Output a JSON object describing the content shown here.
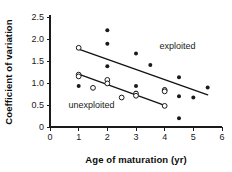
{
  "chart_data": {
    "type": "scatter",
    "title": "",
    "xlabel": "Age of maturation (yr)",
    "ylabel": "Coefficient of variation",
    "xlim": [
      0,
      6
    ],
    "ylim": [
      0,
      2.5
    ],
    "xticks": [
      "0",
      "1",
      "2",
      "3",
      "4",
      "5",
      "6"
    ],
    "xtick_values": [
      0,
      1,
      2,
      3,
      4,
      5,
      6
    ],
    "yticks": [
      "0",
      "0.5",
      "1.0",
      "1.5",
      "2.0",
      "2.5"
    ],
    "ytick_values": [
      0,
      0.5,
      1.0,
      1.5,
      2.0,
      2.5
    ],
    "grid": false,
    "legend_position": "in-plot-annotations",
    "series": [
      {
        "name": "exploited",
        "marker": "filled-circle",
        "color": "#1a1a1a",
        "label_text": "exploited",
        "label_x": 4.45,
        "label_y": 1.78,
        "points": [
          {
            "x": 1.0,
            "y": 0.93
          },
          {
            "x": 2.0,
            "y": 2.2
          },
          {
            "x": 2.0,
            "y": 1.89
          },
          {
            "x": 2.0,
            "y": 1.38
          },
          {
            "x": 3.0,
            "y": 1.67
          },
          {
            "x": 3.0,
            "y": 0.93
          },
          {
            "x": 3.0,
            "y": 0.78
          },
          {
            "x": 3.5,
            "y": 1.41
          },
          {
            "x": 4.0,
            "y": 0.86
          },
          {
            "x": 4.5,
            "y": 1.13
          },
          {
            "x": 4.5,
            "y": 0.7
          },
          {
            "x": 4.5,
            "y": 0.2
          },
          {
            "x": 5.0,
            "y": 0.67
          },
          {
            "x": 5.5,
            "y": 0.9
          },
          {
            "x": 2.5,
            "y": 0.68
          }
        ],
        "trend": {
          "x1": 1.0,
          "y1": 1.77,
          "x2": 5.5,
          "y2": 0.73
        }
      },
      {
        "name": "unexploited",
        "marker": "open-circle",
        "color": "#1a1a1a",
        "label_text": "unexploited",
        "label_x": 1.45,
        "label_y": 0.44,
        "points": [
          {
            "x": 1.0,
            "y": 1.8
          },
          {
            "x": 1.0,
            "y": 1.19
          },
          {
            "x": 1.0,
            "y": 1.15
          },
          {
            "x": 1.5,
            "y": 0.89
          },
          {
            "x": 2.0,
            "y": 1.07
          },
          {
            "x": 2.0,
            "y": 0.99
          },
          {
            "x": 2.5,
            "y": 0.67
          },
          {
            "x": 3.0,
            "y": 0.76
          },
          {
            "x": 3.0,
            "y": 0.71
          },
          {
            "x": 4.0,
            "y": 0.84
          },
          {
            "x": 4.0,
            "y": 0.81
          },
          {
            "x": 4.0,
            "y": 0.48
          }
        ],
        "trend": {
          "x1": 1.0,
          "y1": 1.2,
          "x2": 4.0,
          "y2": 0.49
        }
      }
    ]
  }
}
